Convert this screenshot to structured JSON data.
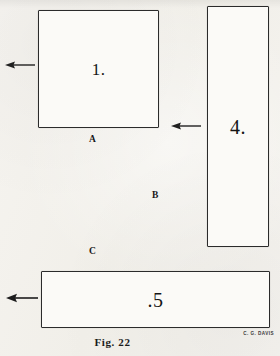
{
  "figure": {
    "caption": "Fig. 22",
    "signature": "C. G. DAVIS",
    "background_color": "#f4f2ee",
    "line_color": "#2b2b2b",
    "text_color": "#141414"
  },
  "shapes": [
    {
      "id": "rect-1",
      "kind": "rectangle",
      "label": "1.",
      "x": 38,
      "y": 10,
      "width": 121,
      "height": 118
    },
    {
      "id": "rect-4",
      "kind": "rectangle",
      "label": "4.",
      "x": 207,
      "y": 6,
      "width": 62,
      "height": 241
    },
    {
      "id": "rect-5",
      "kind": "rectangle",
      "label": ".5",
      "x": 41,
      "y": 271,
      "width": 229,
      "height": 57
    }
  ],
  "point_labels": [
    {
      "id": "point-a",
      "text": "A",
      "x": 89,
      "y": 135
    },
    {
      "id": "point-b",
      "text": "B",
      "x": 152,
      "y": 191
    },
    {
      "id": "point-c",
      "text": "C",
      "x": 89,
      "y": 247
    }
  ],
  "arrows": [
    {
      "id": "arrow-left-top",
      "direction": "left",
      "x": 4,
      "y": 59,
      "length": 32
    },
    {
      "id": "arrow-left-middle",
      "direction": "left",
      "x": 170,
      "y": 120,
      "length": 32
    },
    {
      "id": "arrow-left-bottom",
      "direction": "left",
      "x": 5,
      "y": 292,
      "length": 34
    }
  ]
}
